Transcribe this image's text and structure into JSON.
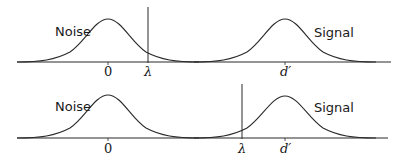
{
  "diagram": {
    "title": "",
    "panels": [
      {
        "id": "top",
        "noise_label": "Noise",
        "signal_label": "Signal",
        "noise_mean_label": "0",
        "criterion_label": "λ",
        "signal_mean_label": "d′",
        "criterion_position": "between distributions, right of noise mean"
      },
      {
        "id": "bottom",
        "noise_label": "Noise",
        "signal_label": "Signal",
        "noise_mean_label": "0",
        "criterion_label": "λ",
        "signal_mean_label": "d′",
        "criterion_position": "left of signal mean"
      }
    ]
  }
}
